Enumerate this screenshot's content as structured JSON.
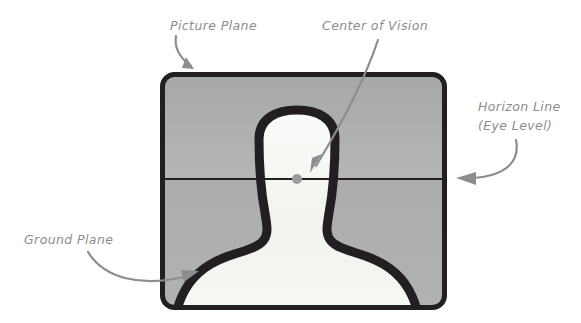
{
  "diagram": {
    "background_color": "#ffffff",
    "frame": {
      "name": "picture-plane-frame",
      "border_color": "#231f20",
      "sky_color_top": "#a9a9a9",
      "sky_color_bottom": "#b4b4b4",
      "ground_color_top": "#adadad",
      "ground_color_bottom": "#b0b0b0",
      "x": 160,
      "y": 72,
      "width": 287,
      "height": 238,
      "corner_radius": 14,
      "border_width": 5
    },
    "horizon": {
      "name": "horizon-line",
      "color": "#231f20",
      "y": 179,
      "x_start": 160,
      "x_end": 447,
      "thickness": 2
    },
    "center_of_vision_dot": {
      "name": "center-of-vision-dot",
      "color": "#9a9a9a",
      "cx": 297,
      "cy": 179,
      "r": 5
    },
    "figure": {
      "name": "silhouette-figure",
      "outline_color": "#231f20",
      "fill_color": "#f4f4f0",
      "stroke_width": 9
    },
    "annotation_color": "#8d8d8d",
    "labels": [
      {
        "id": "picture-plane",
        "text": "Picture Plane",
        "x": 170,
        "y": 30,
        "anchor": "start"
      },
      {
        "id": "center-of-vision",
        "text": "Center of Vision",
        "x": 322,
        "y": 30,
        "anchor": "start"
      },
      {
        "id": "horizon-line-1",
        "text": "Horizon Line",
        "x": 478,
        "y": 111,
        "anchor": "start"
      },
      {
        "id": "horizon-line-2",
        "text": "(Eye Level)",
        "x": 478,
        "y": 130,
        "anchor": "start"
      },
      {
        "id": "ground-plane",
        "text": "Ground Plane",
        "x": 24,
        "y": 244,
        "anchor": "start"
      }
    ],
    "arrows": [
      {
        "id": "picture-plane-arrow",
        "from": "Picture Plane label",
        "to": "top edge of frame"
      },
      {
        "id": "center-of-vision-arrow",
        "from": "Center of Vision label",
        "to": "center of vision dot"
      },
      {
        "id": "horizon-line-arrow",
        "from": "Horizon Line (Eye Level) label",
        "to": "right end of horizon line"
      },
      {
        "id": "ground-plane-arrow",
        "from": "Ground Plane label",
        "to": "ground area inside frame"
      }
    ]
  }
}
